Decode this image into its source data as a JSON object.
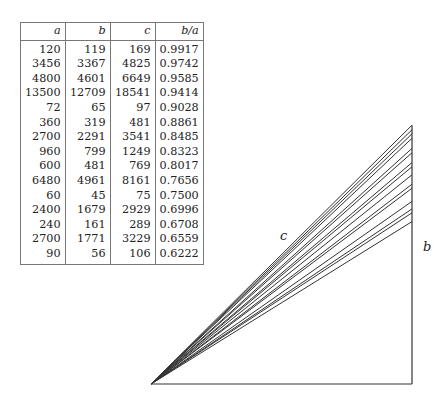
{
  "table": {
    "headers": [
      "a",
      "b",
      "c",
      "b/a"
    ],
    "rows": [
      [
        "120",
        "119",
        "169",
        "0.9917"
      ],
      [
        "3456",
        "3367",
        "4825",
        "0.9742"
      ],
      [
        "4800",
        "4601",
        "6649",
        "0.9585"
      ],
      [
        "13500",
        "12709",
        "18541",
        "0.9414"
      ],
      [
        "72",
        "65",
        "97",
        "0.9028"
      ],
      [
        "360",
        "319",
        "481",
        "0.8861"
      ],
      [
        "2700",
        "2291",
        "3541",
        "0.8485"
      ],
      [
        "960",
        "799",
        "1249",
        "0.8323"
      ],
      [
        "600",
        "481",
        "769",
        "0.8017"
      ],
      [
        "6480",
        "4961",
        "8161",
        "0.7656"
      ],
      [
        "60",
        "45",
        "75",
        "0.7500"
      ],
      [
        "2400",
        "1679",
        "2929",
        "0.6996"
      ],
      [
        "240",
        "161",
        "289",
        "0.6708"
      ],
      [
        "2700",
        "1771",
        "3229",
        "0.6559"
      ],
      [
        "90",
        "56",
        "106",
        "0.6222"
      ]
    ]
  },
  "diagram": {
    "ratios": [
      0.9917,
      0.9742,
      0.9585,
      0.9414,
      0.9028,
      0.8861,
      0.8485,
      0.8323,
      0.8017,
      0.7656,
      0.75,
      0.6996,
      0.6708,
      0.6559,
      0.6222
    ],
    "label_c": "c",
    "label_b": "b",
    "line_color": "#333333"
  }
}
